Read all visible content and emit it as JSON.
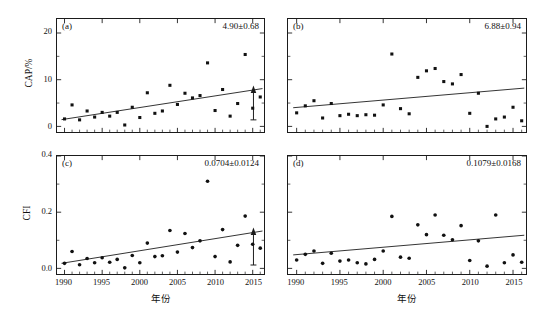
{
  "figure": {
    "top_partial_text": "",
    "xlabel": "年份",
    "xticks": [
      "1990",
      "1995",
      "2000",
      "2005",
      "2010",
      "2015"
    ],
    "xlim": [
      1989,
      2016.5
    ]
  },
  "chart_data": [
    {
      "type": "scatter",
      "panel": "a",
      "tag": "(a)",
      "annotation": "4.90±0.68",
      "ylabel": "CAP/%",
      "xlabel": "年份",
      "yticks": [
        "0",
        "10",
        "20"
      ],
      "ylim": [
        -1.2,
        23
      ],
      "xlim": [
        1989,
        2016.5
      ],
      "marker": "square",
      "grid": false,
      "trendline": {
        "x": [
          1989.6,
          2016.3
        ],
        "y": [
          1.45,
          8.1
        ]
      },
      "arrow_marker": {
        "x": 2015.1,
        "y_top": 8.0,
        "y_bottom": 1.4
      },
      "x": [
        1990,
        1991,
        1992,
        1993,
        1994,
        1995,
        1996,
        1997,
        1998,
        1999,
        2000,
        2001,
        2002,
        2003,
        2004,
        2005,
        2006,
        2007,
        2008,
        2009,
        2010,
        2011,
        2012,
        2013,
        2014,
        2015,
        2016
      ],
      "y": [
        1.6,
        4.6,
        1.4,
        3.3,
        2.0,
        3.0,
        2.2,
        3.0,
        0.3,
        4.1,
        1.9,
        7.2,
        2.8,
        3.3,
        8.8,
        4.7,
        7.1,
        6.1,
        6.6,
        13.6,
        3.4,
        7.9,
        2.2,
        4.9,
        15.4,
        3.9,
        6.3
      ]
    },
    {
      "type": "scatter",
      "panel": "b",
      "tag": "(b)",
      "annotation": "6.88±0.94",
      "ylabel": "",
      "xlabel": "年份",
      "yticks": [],
      "ylim": [
        -1.2,
        23
      ],
      "xlim": [
        1989,
        2016.5
      ],
      "marker": "square",
      "grid": false,
      "trendline": {
        "x": [
          1989.6,
          2016.3
        ],
        "y": [
          4.0,
          8.2
        ]
      },
      "x": [
        1990,
        1991,
        1992,
        1993,
        1994,
        1995,
        1996,
        1997,
        1998,
        1999,
        2000,
        2001,
        2002,
        2003,
        2004,
        2005,
        2006,
        2007,
        2008,
        2009,
        2010,
        2011,
        2012,
        2013,
        2014,
        2015,
        2016
      ],
      "y": [
        2.9,
        4.4,
        5.5,
        1.8,
        4.9,
        2.3,
        2.6,
        2.3,
        2.5,
        2.4,
        4.6,
        15.5,
        3.8,
        2.7,
        10.5,
        11.9,
        12.4,
        9.6,
        9.1,
        11.1,
        2.8,
        7.1,
        0.0,
        1.6,
        2.0,
        4.1,
        1.2
      ]
    },
    {
      "type": "scatter",
      "panel": "c",
      "tag": "(c)",
      "annotation": "0.0704±0.0124",
      "ylabel": "CFI",
      "xlabel": "年份",
      "yticks": [
        "0.0",
        "0.2",
        "0.4"
      ],
      "ylim": [
        -0.02,
        0.4
      ],
      "xlim": [
        1989,
        2016.5
      ],
      "marker": "circle",
      "grid": false,
      "trendline": {
        "x": [
          1989.6,
          2016.3
        ],
        "y": [
          0.018,
          0.133
        ]
      },
      "arrow_marker": {
        "x": 2015.1,
        "y_top": 0.133,
        "y_bottom": 0.012
      },
      "x": [
        1990,
        1991,
        1992,
        1993,
        1994,
        1995,
        1996,
        1997,
        1998,
        1999,
        2000,
        2001,
        2002,
        2003,
        2004,
        2005,
        2006,
        2007,
        2008,
        2009,
        2010,
        2011,
        2012,
        2013,
        2014,
        2015,
        2016
      ],
      "y": [
        0.018,
        0.06,
        0.013,
        0.035,
        0.02,
        0.038,
        0.022,
        0.032,
        0.002,
        0.046,
        0.02,
        0.09,
        0.042,
        0.045,
        0.135,
        0.058,
        0.124,
        0.074,
        0.098,
        0.31,
        0.042,
        0.138,
        0.023,
        0.082,
        0.186,
        0.086,
        0.072
      ]
    },
    {
      "type": "scatter",
      "panel": "d",
      "tag": "(d)",
      "annotation": "0.1079±0.0168",
      "ylabel": "",
      "xlabel": "年份",
      "yticks": [],
      "ylim": [
        -0.02,
        0.4
      ],
      "xlim": [
        1989,
        2016.5
      ],
      "marker": "circle",
      "grid": false,
      "trendline": {
        "x": [
          1989.6,
          2016.3
        ],
        "y": [
          0.048,
          0.118
        ]
      },
      "x": [
        1990,
        1991,
        1992,
        1993,
        1994,
        1995,
        1996,
        1997,
        1998,
        1999,
        2000,
        2001,
        2002,
        2003,
        2004,
        2005,
        2006,
        2007,
        2008,
        2009,
        2010,
        2011,
        2012,
        2013,
        2014,
        2015,
        2016
      ],
      "y": [
        0.03,
        0.05,
        0.062,
        0.018,
        0.054,
        0.026,
        0.03,
        0.02,
        0.016,
        0.032,
        0.062,
        0.185,
        0.04,
        0.036,
        0.155,
        0.12,
        0.19,
        0.118,
        0.102,
        0.152,
        0.028,
        0.098,
        0.008,
        0.19,
        0.02,
        0.048,
        0.022
      ]
    }
  ]
}
